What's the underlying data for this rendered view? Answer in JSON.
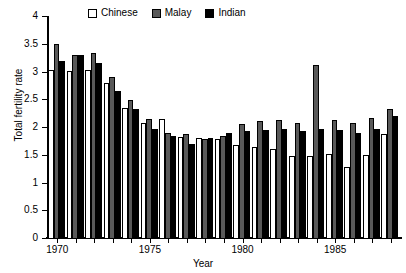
{
  "chart_data": {
    "type": "bar",
    "title": "",
    "xlabel": "Year",
    "ylabel": "Total fertility rate",
    "ylim": [
      0,
      4
    ],
    "ytick_labels": [
      "0",
      "0.5",
      "1",
      "1.5",
      "2",
      "2.5",
      "3",
      "3.5",
      "4"
    ],
    "ytick_values": [
      0,
      0.5,
      1,
      1.5,
      2,
      2.5,
      3,
      3.5,
      4
    ],
    "xtick_labels": [
      "1970",
      "1975",
      "1980",
      "1985"
    ],
    "xtick_values": [
      1970,
      1975,
      1980,
      1985
    ],
    "grid": false,
    "legend_position": "top-center",
    "categories": [
      "1970",
      "1971",
      "1972",
      "1973",
      "1974",
      "1975",
      "1976",
      "1977",
      "1978",
      "1979",
      "1980",
      "1981",
      "1982",
      "1983",
      "1984",
      "1985",
      "1986",
      "1987",
      "1988"
    ],
    "series": [
      {
        "name": "Chinese",
        "color": "#ffffff",
        "values": [
          3.02,
          3.01,
          3.02,
          2.8,
          2.34,
          2.08,
          2.15,
          1.82,
          1.8,
          1.78,
          1.67,
          1.64,
          1.61,
          1.47,
          1.48,
          1.52,
          1.28,
          1.49,
          1.88
        ]
      },
      {
        "name": "Malay",
        "color": "#595959",
        "values": [
          3.5,
          3.3,
          3.33,
          2.9,
          2.48,
          2.14,
          1.9,
          1.88,
          1.79,
          1.84,
          2.05,
          2.1,
          2.12,
          2.07,
          3.11,
          2.12,
          2.07,
          2.17,
          2.32
        ]
      },
      {
        "name": "Indian",
        "color": "#000000",
        "values": [
          3.19,
          3.3,
          3.16,
          2.64,
          2.32,
          1.97,
          1.84,
          1.69,
          1.8,
          1.89,
          1.93,
          1.95,
          1.97,
          1.92,
          1.96,
          1.95,
          1.89,
          1.96,
          2.2
        ]
      }
    ]
  },
  "legend": {
    "entries": [
      {
        "label": "Chinese",
        "swatch": "white-square-swatch"
      },
      {
        "label": "Malay",
        "swatch": "gray-square-swatch"
      },
      {
        "label": "Indian",
        "swatch": "black-square-swatch"
      }
    ]
  },
  "axes": {
    "y_title": "Total fertility rate",
    "x_title": "Year"
  }
}
